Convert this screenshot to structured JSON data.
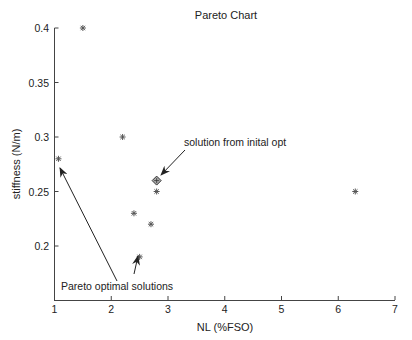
{
  "chart_data": {
    "type": "scatter",
    "title": "Pareto Chart",
    "xlabel": "NL (%FSO)",
    "ylabel": "stiffness (N/m)",
    "xlim": [
      1,
      7
    ],
    "ylim": [
      0.15,
      0.4
    ],
    "grid": false,
    "x_ticks": [
      1,
      2,
      3,
      4,
      5,
      6,
      7
    ],
    "y_ticks": [
      0.2,
      0.25,
      0.3,
      0.35,
      0.4
    ],
    "x_tick_labels": [
      "1",
      "2",
      "3",
      "4",
      "5",
      "6",
      "7"
    ],
    "y_tick_labels": [
      "0.2",
      "0.25",
      "0.3",
      "0.35",
      "0.4"
    ],
    "series": [
      {
        "name": "solutions",
        "marker": "asterisk",
        "points": [
          {
            "x": 1.5,
            "y": 0.4
          },
          {
            "x": 1.07,
            "y": 0.28
          },
          {
            "x": 2.2,
            "y": 0.3
          },
          {
            "x": 2.4,
            "y": 0.23
          },
          {
            "x": 2.5,
            "y": 0.19
          },
          {
            "x": 2.7,
            "y": 0.22
          },
          {
            "x": 2.8,
            "y": 0.25
          },
          {
            "x": 6.3,
            "y": 0.25
          }
        ]
      },
      {
        "name": "initial optimum",
        "marker": "diamond",
        "points": [
          {
            "x": 2.8,
            "y": 0.26
          }
        ]
      }
    ],
    "annotations": [
      {
        "text": "solution from inital opt",
        "points_to": {
          "x": 2.8,
          "y": 0.26
        }
      },
      {
        "text": "Pareto optimal solutions",
        "points_to": [
          {
            "x": 1.07,
            "y": 0.28
          },
          {
            "x": 2.5,
            "y": 0.19
          }
        ]
      }
    ]
  }
}
